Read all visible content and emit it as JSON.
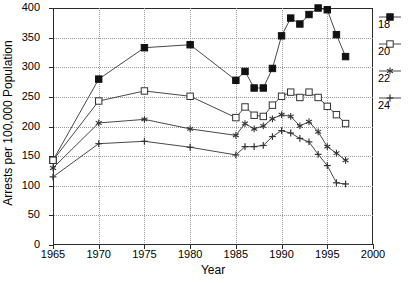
{
  "chart_data": {
    "type": "line",
    "title": "",
    "xlabel": "Year",
    "ylabel": "Arrests per 100,000 Population",
    "xlim": [
      1965,
      2000
    ],
    "ylim": [
      0,
      400
    ],
    "xticks": [
      1965,
      1970,
      1975,
      1980,
      1985,
      1990,
      1995,
      2000
    ],
    "yticks": [
      0,
      50,
      100,
      150,
      200,
      250,
      300,
      350,
      400
    ],
    "grid": true,
    "legend_position": "right",
    "series": [
      {
        "name": "18",
        "marker": "filled-square",
        "x": [
          1965,
          1970,
          1975,
          1980,
          1985,
          1986,
          1987,
          1988,
          1989,
          1990,
          1991,
          1992,
          1993,
          1994,
          1995,
          1996,
          1997
        ],
        "values": [
          143,
          280,
          333,
          338,
          278,
          293,
          265,
          265,
          298,
          353,
          383,
          373,
          389,
          400,
          397,
          355,
          318
        ]
      },
      {
        "name": "20",
        "marker": "open-square",
        "x": [
          1965,
          1970,
          1975,
          1980,
          1985,
          1986,
          1987,
          1988,
          1989,
          1990,
          1991,
          1992,
          1993,
          1994,
          1995,
          1996,
          1997
        ],
        "values": [
          143,
          243,
          260,
          251,
          215,
          233,
          219,
          217,
          236,
          251,
          258,
          249,
          258,
          249,
          234,
          220,
          205
        ]
      },
      {
        "name": "22",
        "marker": "asterisk",
        "x": [
          1965,
          1970,
          1975,
          1980,
          1985,
          1986,
          1987,
          1988,
          1989,
          1990,
          1991,
          1992,
          1993,
          1994,
          1995,
          1996,
          1997
        ],
        "values": [
          130,
          206,
          212,
          196,
          185,
          205,
          196,
          201,
          213,
          220,
          217,
          201,
          208,
          191,
          166,
          155,
          143
        ]
      },
      {
        "name": "24",
        "marker": "plus",
        "x": [
          1965,
          1970,
          1975,
          1980,
          1985,
          1986,
          1987,
          1988,
          1989,
          1990,
          1991,
          1992,
          1993,
          1994,
          1995,
          1996,
          1997
        ],
        "values": [
          115,
          171,
          175,
          165,
          152,
          166,
          166,
          168,
          183,
          193,
          189,
          180,
          174,
          153,
          134,
          105,
          103
        ]
      }
    ],
    "legend_entries": [
      "18",
      "20",
      "22",
      "24"
    ],
    "colors": {
      "line": "#333333",
      "grid": "#9a9a9a",
      "axis": "#2b2b2b",
      "text": "#000000"
    }
  }
}
